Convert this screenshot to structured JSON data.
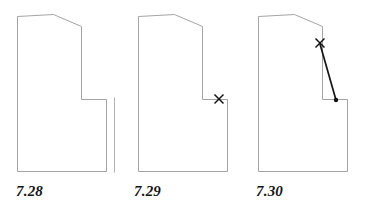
{
  "page": {
    "background_color": "#ffffff",
    "outline_color": "#9a9a9a",
    "mark_color": "#121212",
    "label_color": "#141414"
  },
  "figures": [
    {
      "id": "fig-7-28",
      "label": "7.28",
      "description": "Pattern block outline with detached vertical guide line at right",
      "outline_path": "M 17.5 16.5 L 53.5 14.5 L 81.5 26.5 L 81.5 99.5 L 106.5 99.5 L 106.5 171.5 L 17.5 171.5 Z",
      "aux_lines": [
        {
          "name": "detached-vertical-guide",
          "path": "M 114.5 97.5 L 114.5 172.5"
        }
      ],
      "cross_marks": [],
      "dart_lines": [],
      "dart_points": []
    },
    {
      "id": "fig-7-29",
      "label": "7.29",
      "description": "Pattern block outline with cross mark at notch corner",
      "outline_path": "M 16.5 16.5 L 52.5 14.5 L 80.5 26.5 L 80.5 99.5 L 105.5 99.5 L 105.5 171.5 L 16.5 171.5 Z",
      "aux_lines": [],
      "cross_marks": [
        {
          "name": "notch-cross-mark",
          "x": 97,
          "y": 99,
          "size": 4.5
        }
      ],
      "dart_lines": [],
      "dart_points": []
    },
    {
      "id": "fig-7-30",
      "label": "7.30",
      "description": "Pattern block outline with dart line drawn from cross mark down to notch corner point",
      "outline_path": "M 14.5 16.5 L 50.5 14.5 L 78.5 26.5 L 78.5 99.5 L 103.5 99.5 L 103.5 171.5 L 14.5 171.5 Z",
      "aux_lines": [],
      "cross_marks": [
        {
          "name": "dart-apex-cross-mark",
          "x": 76,
          "y": 43,
          "size": 4.5
        }
      ],
      "dart_lines": [
        {
          "name": "dart-leg-line",
          "x1": 76,
          "y1": 44,
          "x2": 92,
          "y2": 100
        }
      ],
      "dart_points": [
        {
          "name": "dart-end-point",
          "x": 92,
          "y": 100,
          "r": 2.2
        }
      ]
    }
  ]
}
